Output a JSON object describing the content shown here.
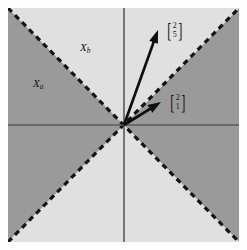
{
  "figure": {
    "type": "vector-diagram",
    "background_color": "#fdfdfd",
    "plot": {
      "left": 8,
      "top": 8,
      "width": 231,
      "height": 234,
      "origin_x": 124,
      "origin_y": 125
    },
    "colors": {
      "dark_region": "#9a9a9a",
      "light_region": "#e0e0e0",
      "axis": "#5a5a5a",
      "dashed_line": "#141414",
      "arrow": "#0d0d0d",
      "text": "#121212"
    }
  },
  "regions": [
    {
      "name": "left-sector",
      "label": "X",
      "subscript": "a",
      "fill": "dark",
      "label_x": 33,
      "label_y": 78
    },
    {
      "name": "top-sector",
      "label": "X",
      "subscript": "b",
      "fill": "light",
      "label_x": 80,
      "label_y": 42
    },
    {
      "name": "right-sector",
      "label": "",
      "subscript": "",
      "fill": "dark",
      "label_x": 0,
      "label_y": 0
    },
    {
      "name": "bottom-sector",
      "label": "",
      "subscript": "",
      "fill": "light",
      "label_x": 0,
      "label_y": 0
    }
  ],
  "axes": {
    "horizontal": {
      "x1": 8,
      "y1": 125,
      "x2": 239,
      "y2": 125
    },
    "vertical": {
      "x1": 124,
      "y1": 8,
      "x2": 124,
      "y2": 242
    }
  },
  "separators": [
    {
      "name": "diagonal-up",
      "x1": 8,
      "y1": 242,
      "x2": 239,
      "y2": 8,
      "style": "dashed"
    },
    {
      "name": "diagonal-down",
      "x1": 8,
      "y1": 8,
      "x2": 239,
      "y2": 242,
      "style": "dashed"
    }
  ],
  "vectors": [
    {
      "name": "vector-2-5",
      "tip_x": 158,
      "tip_y": 30,
      "components": [
        "2",
        "5"
      ],
      "label_x": 166,
      "label_y": 22,
      "bracket_left": "[",
      "bracket_right": "]"
    },
    {
      "name": "vector-2-1",
      "tip_x": 161,
      "tip_y": 102,
      "components": [
        "2",
        "1"
      ],
      "label_x": 169,
      "label_y": 94,
      "bracket_left": "[",
      "bracket_right": "]"
    }
  ],
  "chart_data": {
    "type": "scatter",
    "title": "",
    "xlabel": "",
    "ylabel": "",
    "series": [
      {
        "name": "[2,5]",
        "x": 2,
        "y": 5
      },
      {
        "name": "[2,1]",
        "x": 2,
        "y": 1
      }
    ],
    "annotations": [
      "X_a",
      "X_b"
    ],
    "grid": false,
    "legend": "none"
  }
}
